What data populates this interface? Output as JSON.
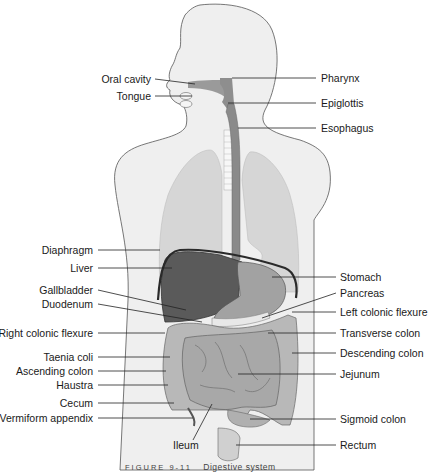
{
  "diagram": {
    "title": "Digestive system",
    "caption": {
      "figure_label": "FIGURE 9-11",
      "text": "Digestive system"
    },
    "colors": {
      "body_fill": "#efefef",
      "body_outline": "#555555",
      "lung_fill": "#d6d6d6",
      "liver_fill": "#5a5a5a",
      "stomach_fill": "#9e9e9e",
      "intestine_fill": "#b4b4b4",
      "esophagus_fill": "#8a8a8a",
      "diaphragm_stroke": "#2a2a2a",
      "leader_line": "#222222"
    },
    "labels_left": [
      {
        "id": "oral-cavity",
        "text": "Oral cavity"
      },
      {
        "id": "tongue",
        "text": "Tongue"
      },
      {
        "id": "diaphragm",
        "text": "Diaphragm"
      },
      {
        "id": "liver",
        "text": "Liver"
      },
      {
        "id": "gallbladder",
        "text": "Gallbladder"
      },
      {
        "id": "duodenum",
        "text": "Duodenum"
      },
      {
        "id": "right-colonic-flexure",
        "text": "Right colonic flexure"
      },
      {
        "id": "taenia-coli",
        "text": "Taenia coli"
      },
      {
        "id": "ascending-colon",
        "text": "Ascending colon"
      },
      {
        "id": "haustra",
        "text": "Haustra"
      },
      {
        "id": "cecum",
        "text": "Cecum"
      },
      {
        "id": "vermiform-appendix",
        "text": "Vermiform appendix"
      }
    ],
    "labels_right": [
      {
        "id": "pharynx",
        "text": "Pharynx"
      },
      {
        "id": "epiglottis",
        "text": "Epiglottis"
      },
      {
        "id": "esophagus",
        "text": "Esophagus"
      },
      {
        "id": "stomach",
        "text": "Stomach"
      },
      {
        "id": "pancreas",
        "text": "Pancreas"
      },
      {
        "id": "left-colonic-flexure",
        "text": "Left colonic flexure"
      },
      {
        "id": "transverse-colon",
        "text": "Transverse colon"
      },
      {
        "id": "descending-colon",
        "text": "Descending colon"
      },
      {
        "id": "jejunum",
        "text": "Jejunum"
      },
      {
        "id": "sigmoid-colon",
        "text": "Sigmoid colon"
      },
      {
        "id": "rectum",
        "text": "Rectum"
      }
    ],
    "labels_bottom": [
      {
        "id": "ileum",
        "text": "Ileum"
      }
    ]
  }
}
